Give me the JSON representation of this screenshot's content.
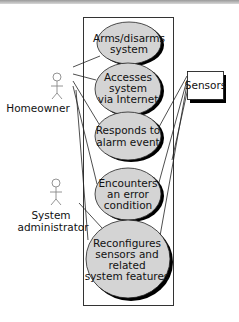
{
  "diagram": {
    "type": "uml-use-case",
    "colors": {
      "ellipse_fill": "#d4d4d4",
      "ellipse_shadow": "#000000",
      "line": "#222222",
      "actor_stroke": "#888888",
      "top_bar": "#9a9a9a"
    },
    "actors": [
      {
        "id": "homeowner",
        "label": "Homeowner",
        "lines": [
          "Homeowner"
        ]
      },
      {
        "id": "sysadmin",
        "label": "System administrator",
        "lines": [
          "System",
          "administrator"
        ]
      }
    ],
    "external": {
      "id": "sensors",
      "label": "Sensors"
    },
    "use_cases": [
      {
        "id": "arms",
        "lines": [
          "Arms/disarms",
          "system"
        ]
      },
      {
        "id": "access",
        "lines": [
          "Accesses",
          "system",
          "via Internet"
        ]
      },
      {
        "id": "responds",
        "lines": [
          "Responds to",
          "alarm event"
        ]
      },
      {
        "id": "error",
        "lines": [
          "Encounters",
          "an error",
          "condition"
        ]
      },
      {
        "id": "reconfig",
        "lines": [
          "Reconfigures",
          "sensors and",
          "related",
          "system features"
        ]
      }
    ],
    "associations": [
      [
        "homeowner",
        "arms"
      ],
      [
        "homeowner",
        "access"
      ],
      [
        "homeowner",
        "responds"
      ],
      [
        "homeowner",
        "error"
      ],
      [
        "homeowner",
        "reconfig"
      ],
      [
        "sysadmin",
        "reconfig"
      ],
      [
        "sensors",
        "responds"
      ],
      [
        "sensors",
        "error"
      ],
      [
        "sensors",
        "reconfig"
      ]
    ]
  }
}
